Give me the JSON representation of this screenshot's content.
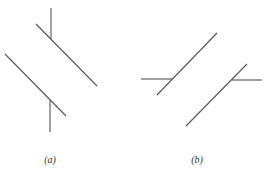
{
  "canvas": {
    "width": 267,
    "height": 172,
    "background": "#ffffff",
    "stroke_color": "#555555"
  },
  "panels": [
    {
      "id": "a",
      "label": "(a)",
      "label_pos": {
        "x": 50,
        "y": 154
      },
      "segments": [
        {
          "name": "upper-diagonal",
          "x1": 36,
          "y1": 24,
          "x2": 97,
          "y2": 86
        },
        {
          "name": "upper-vertical-stub",
          "x1": 51,
          "y1": 8,
          "x2": 51,
          "y2": 39
        },
        {
          "name": "lower-diagonal",
          "x1": 5,
          "y1": 54,
          "x2": 66,
          "y2": 116
        },
        {
          "name": "lower-vertical-stub",
          "x1": 50,
          "y1": 100,
          "x2": 50,
          "y2": 132
        }
      ]
    },
    {
      "id": "b",
      "label": "(b)",
      "label_pos": {
        "x": 197,
        "y": 154
      },
      "segments": [
        {
          "name": "upper-diagonal",
          "x1": 157,
          "y1": 95,
          "x2": 217,
          "y2": 33
        },
        {
          "name": "left-horizontal-stub",
          "x1": 141,
          "y1": 79,
          "x2": 172,
          "y2": 79
        },
        {
          "name": "lower-diagonal",
          "x1": 186,
          "y1": 126,
          "x2": 247,
          "y2": 64
        },
        {
          "name": "right-horizontal-stub",
          "x1": 232,
          "y1": 80,
          "x2": 262,
          "y2": 80
        }
      ]
    }
  ]
}
